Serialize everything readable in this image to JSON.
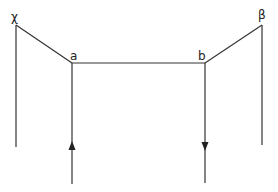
{
  "diagram": {
    "type": "feynman-like line diagram",
    "labels": {
      "chi": "χ",
      "a": "a",
      "b": "b",
      "beta": "β"
    },
    "line_color": "#333333",
    "arrows": [
      {
        "on": "left-external-line",
        "direction": "up"
      },
      {
        "on": "right-external-line",
        "direction": "down"
      }
    ]
  }
}
